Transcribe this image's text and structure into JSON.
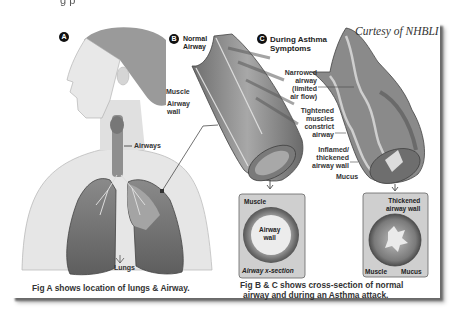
{
  "top_clipped_text": "g                                       p",
  "credit": "Curtesy of NHBLI",
  "panel_a": {
    "marker": "A",
    "labels": {
      "airways": "Airways",
      "lungs": "Lungs"
    },
    "caption": "Fig A shows location of lungs & Airway."
  },
  "panel_b": {
    "marker": "B",
    "heading_line1": "Normal",
    "heading_line2": "Airway",
    "labels": {
      "muscle": "Muscle",
      "airway_wall_1": "Airway",
      "airway_wall_2": "wall"
    },
    "cross_section": {
      "muscle": "Muscle",
      "airway_wall_1": "Airway",
      "airway_wall_2": "wall",
      "title": "Airway x-section"
    }
  },
  "panel_c": {
    "marker": "C",
    "heading_line1": "During Asthma",
    "heading_line2": "Symptoms",
    "labels": {
      "narrowed": [
        "Narrowed",
        "airway",
        "(limited",
        "air flow)"
      ],
      "tightened": [
        "Tightened",
        "muscles",
        "constrict",
        "airway"
      ],
      "inflamed": [
        "Inflamed/",
        "thickened",
        "airway wall"
      ],
      "mucus": "Mucus"
    },
    "cross_section": {
      "thickened_1": "Thickened",
      "thickened_2": "airway wall",
      "muscle": "Muscle",
      "mucus": "Mucus"
    }
  },
  "caption_bc": {
    "line1": "Fig B & C shows cross-section of normal",
    "line2": "airway and during an Asthma attack."
  },
  "colors": {
    "background": "#ffffff",
    "card": "#ffffff",
    "shadow": "#6a6a6a",
    "skin": "#e2e2e2",
    "lung": "#7a7a7a",
    "airway_tube": "#8c8c8c",
    "xsection_box": "#cfcfcf"
  }
}
